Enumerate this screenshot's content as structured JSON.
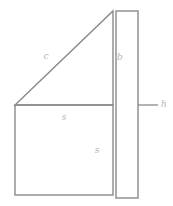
{
  "diagram": {
    "canvas": {
      "width": 173,
      "height": 206,
      "background": "#ffffff"
    },
    "style": {
      "line_color": "#8a8a8a",
      "label_color": "#b4b4b4",
      "line_width": 1.4,
      "label_font_size": 9
    },
    "labels": {
      "hypotenuse": "c",
      "bar_height": "b",
      "square_top": "s",
      "square_side": "s",
      "bar_width": "h"
    },
    "label_positions": {
      "hypotenuse": {
        "x": 46,
        "y": 56
      },
      "bar_height": {
        "x": 120,
        "y": 57
      },
      "square_top": {
        "x": 64,
        "y": 117
      },
      "square_side": {
        "x": 97,
        "y": 150
      },
      "bar_width": {
        "x": 164,
        "y": 104
      }
    },
    "shapes": {
      "triangle": {
        "name": "right-triangle",
        "points": "15,105 113,11 113,105",
        "vertices": [
          {
            "x": 15,
            "y": 105
          },
          {
            "x": 113,
            "y": 11
          },
          {
            "x": 113,
            "y": 105
          }
        ]
      },
      "square": {
        "name": "square",
        "x": 15,
        "y": 105,
        "width": 98,
        "height": 90
      },
      "bar": {
        "name": "vertical-bar",
        "x": 116,
        "y": 11,
        "width": 22,
        "height": 187
      },
      "leader": {
        "name": "bar-width-leader",
        "x1": 138,
        "y1": 105,
        "x2": 158,
        "y2": 105
      }
    }
  }
}
